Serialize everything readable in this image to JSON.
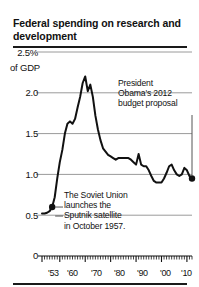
{
  "figure": {
    "title": "Federal spending on research and development"
  },
  "chart_data": {
    "type": "line",
    "title": "Federal spending on research and development",
    "xlabel": "",
    "ylabel": "% of GDP",
    "y_axis_top_label": "2.5%",
    "y_axis_unit_label": "of GDP",
    "ylim": [
      0,
      2.5
    ],
    "xlim": [
      1953,
      2012
    ],
    "grid": true,
    "gridlines": [
      0.5,
      1.0,
      1.5,
      2.0,
      2.5
    ],
    "ytick_labels": [
      "0",
      "0.5",
      "1.0",
      "1.5",
      "2.0",
      "2.5%"
    ],
    "xtick_labels": [
      "'53",
      "'60",
      "'70",
      "'80",
      "'90",
      "'00",
      "'10"
    ],
    "xtick_values": [
      1953,
      1960,
      1970,
      1980,
      1990,
      2000,
      2010
    ],
    "minor_ticks": "annual",
    "legend": "none",
    "x": [
      1953,
      1954,
      1955,
      1956,
      1957,
      1958,
      1959,
      1960,
      1961,
      1962,
      1963,
      1964,
      1965,
      1966,
      1967,
      1968,
      1969,
      1970,
      1971,
      1972,
      1973,
      1974,
      1975,
      1976,
      1977,
      1978,
      1979,
      1980,
      1981,
      1982,
      1983,
      1984,
      1985,
      1986,
      1987,
      1988,
      1989,
      1990,
      1991,
      1992,
      1993,
      1994,
      1995,
      1996,
      1997,
      1998,
      1999,
      2000,
      2001,
      2002,
      2003,
      2004,
      2005,
      2006,
      2007,
      2008,
      2009,
      2010,
      2011,
      2012
    ],
    "values": [
      0.52,
      0.52,
      0.53,
      0.55,
      0.6,
      0.72,
      0.95,
      1.15,
      1.3,
      1.5,
      1.62,
      1.65,
      1.62,
      1.68,
      1.82,
      1.95,
      2.12,
      2.2,
      2.02,
      2.1,
      1.95,
      1.72,
      1.55,
      1.42,
      1.32,
      1.28,
      1.24,
      1.22,
      1.2,
      1.18,
      1.2,
      1.2,
      1.2,
      1.2,
      1.2,
      1.18,
      1.15,
      1.12,
      1.25,
      1.12,
      1.1,
      1.1,
      1.05,
      0.98,
      0.92,
      0.9,
      0.9,
      0.9,
      0.95,
      1.02,
      1.1,
      1.12,
      1.05,
      1.0,
      0.98,
      1.0,
      1.08,
      1.05,
      0.98,
      0.95
    ],
    "markers": [
      {
        "x": 1957,
        "y": 0.6,
        "label": "sputnik-point"
      },
      {
        "x": 2012,
        "y": 0.95,
        "label": "obama-budget-point"
      }
    ],
    "annotations": [
      {
        "id": "obama",
        "text": "President Obama's 2012 budget proposal",
        "lines": [
          "President",
          "Obama's 2012",
          "budget proposal"
        ],
        "points_to": {
          "x": 2012,
          "y": 0.95
        }
      },
      {
        "id": "sputnik",
        "text": "The Soviet Union launches the Sputnik satellite in October 1957.",
        "lines": [
          "The Soviet Union",
          "launches the",
          "Sputnik satellite",
          "in October 1957."
        ],
        "points_to": {
          "x": 1957,
          "y": 0.6
        }
      }
    ],
    "colors": {
      "line": "#111111",
      "grid": "#9a9a9a",
      "axis": "#111111",
      "background": "#ffffff"
    }
  }
}
